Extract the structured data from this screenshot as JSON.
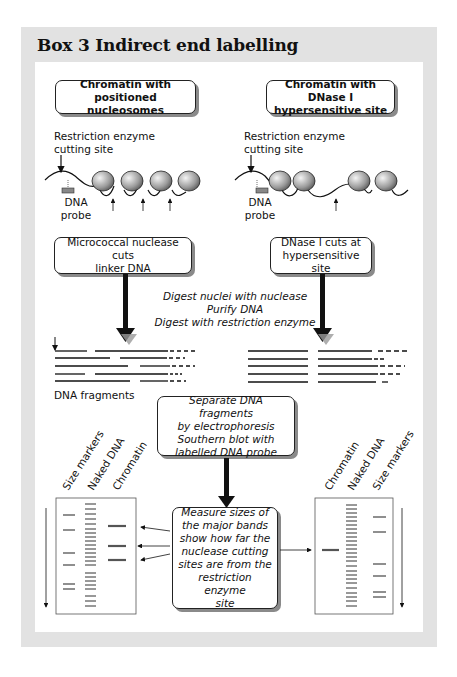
{
  "title": "Box 3  Indirect end labelling",
  "left_column": {
    "header": "Chromatin with positioned nucleosomes",
    "header_lines": [
      "Chromatin with positioned",
      "nucleosomes"
    ],
    "restriction_label_lines": [
      "Restriction enzyme",
      "cutting site"
    ],
    "probe_label_lines": [
      "DNA",
      "probe"
    ],
    "nuclease_box_lines": [
      "Micrococcal nuclease cuts",
      "linker DNA"
    ],
    "fragments_label": "DNA fragments"
  },
  "right_column": {
    "header": "Chromatin with DNase I hypersensitive site",
    "header_lines": [
      "Chromatin with DNase I",
      "hypersensitive site"
    ],
    "restriction_label_lines": [
      "Restriction enzyme",
      "cutting site"
    ],
    "probe_label_lines": [
      "DNA",
      "probe"
    ],
    "nuclease_box_lines": [
      "DNase I cuts at",
      "hypersensitive site"
    ]
  },
  "middle_steps": [
    "Digest nuclei with nuclease",
    "Purify DNA",
    "Digest with restriction enzyme"
  ],
  "separate_box_lines": [
    "Separate DNA fragments",
    "by electrophoresis",
    "Southern blot with",
    "labelled DNA probe"
  ],
  "measure_box_lines": [
    "Measure sizes of",
    "the major bands",
    "show how far the",
    "nuclease cutting",
    "sites are from the",
    "restriction enzyme",
    "site"
  ],
  "left_gel": {
    "lane_labels": [
      "Size markers",
      "Naked DNA",
      "Chromatin"
    ]
  },
  "right_gel": {
    "lane_labels": [
      "Chromatin",
      "Naked DNA",
      "Size markers"
    ]
  },
  "colors": {
    "panel_grey": "#e2e2e2",
    "ink": "#111111",
    "shadow": "#8a8a8a",
    "arrow_shadow": "#9a9a9a"
  }
}
